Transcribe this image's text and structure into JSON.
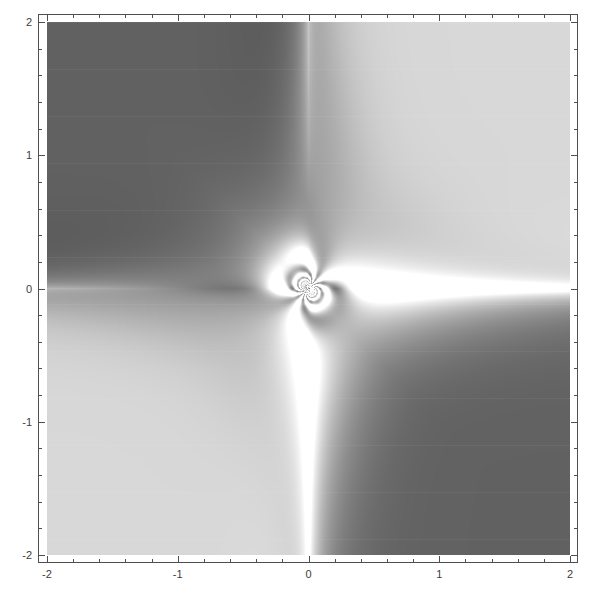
{
  "figure": {
    "title": "",
    "background_color": "#ffffff",
    "frame_color": "#4f4f4f",
    "width": 602,
    "height": 599
  },
  "axes": {
    "x": {
      "label": "",
      "min": -2,
      "max": 2,
      "major_ticks": [
        -2,
        -1,
        0,
        1,
        2
      ],
      "major_tick_labels": [
        "-2",
        "-1",
        "0",
        "1",
        "2"
      ],
      "minor_tick_step": 0.2
    },
    "y": {
      "label": "",
      "min": -2,
      "max": 2,
      "major_ticks": [
        -2,
        -1,
        0,
        1,
        2
      ],
      "major_tick_labels": [
        "-2",
        "-1",
        "0",
        "1",
        "2"
      ],
      "minor_tick_step": 0.2
    }
  },
  "chart_data": {
    "type": "heatmap",
    "title": "",
    "xlabel": "",
    "ylabel": "",
    "xlim": [
      -2,
      2
    ],
    "ylim": [
      -2,
      2
    ],
    "grid": false,
    "legend": "none",
    "colormap": "grayscale",
    "colormap_range": [
      0,
      1
    ],
    "color_low": "#3d3d3d",
    "color_high": "#ffffff",
    "x_tick_labels": [
      "-2",
      "-1",
      "0",
      "1",
      "2"
    ],
    "y_tick_labels": [
      "-2",
      "-1",
      "0",
      "1",
      "2"
    ],
    "x_ticks": [
      -2,
      -1,
      0,
      1,
      2
    ],
    "y_ticks": [
      -2,
      -1,
      0,
      1,
      2
    ],
    "samples_x": 523,
    "samples_y": 533,
    "quadrant_mean_values": {
      "upper_left": 0.3,
      "upper_right": 0.82,
      "lower_left": 0.82,
      "lower_right": 0.3
    },
    "features": [
      {
        "name": "vertical-fringe-band",
        "x_center": 0.0,
        "x_halfwidth": 0.12,
        "description": "dense vertical oscillatory band along x = 0"
      },
      {
        "name": "horizontal-fringe-band",
        "y_center": 0.0,
        "y_halfwidth": 0.08,
        "description": "dense horizontal oscillatory band along y = 0"
      },
      {
        "name": "central-singularity",
        "x": 0.0,
        "y": 0.0,
        "description": "essential singularity with chaotic fine structure"
      },
      {
        "name": "bright-ridge-upper-right",
        "description": "white ridge separating the dark upper-left lobe from the light upper-right lobe"
      },
      {
        "name": "bright-ridge-lower-left",
        "description": "white ridge separating the light lower-left lobe from the dark lower-right lobe"
      }
    ]
  }
}
